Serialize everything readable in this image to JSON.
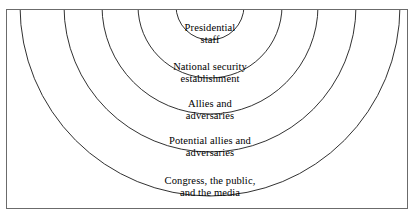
{
  "figure": {
    "type": "concentric-circles-diagram",
    "title": "",
    "frame": {
      "border_color": "#6b6b6b",
      "background_color": "#ffffff"
    },
    "stroke_color": "#1a1a1a",
    "text_color": "#000000"
  },
  "diagram_data": {
    "type": "concentric-rings",
    "center_x": 203,
    "center_y": -4,
    "description": "Five nested concentric circles, clipped by a rectangular frame, labeling audiences from innermost to outermost.",
    "rings": [
      {
        "index": 1,
        "radius": 34,
        "label_lines": [
          "Presidential",
          "staff"
        ],
        "label_x": 203,
        "label_y": 24
      },
      {
        "index": 2,
        "radius": 72,
        "label_lines": [
          "National security",
          "establishment"
        ],
        "label_x": 203,
        "label_y": 63
      },
      {
        "index": 3,
        "radius": 108,
        "label_lines": [
          "Allies and",
          "adversaries"
        ],
        "label_x": 203,
        "label_y": 100
      },
      {
        "index": 4,
        "radius": 146,
        "label_lines": [
          "Potential allies and",
          "adversaries"
        ],
        "label_x": 203,
        "label_y": 137
      },
      {
        "index": 5,
        "radius": 190,
        "label_lines": [
          "Congress, the public,",
          "and the media"
        ],
        "label_x": 203,
        "label_y": 177
      }
    ]
  }
}
